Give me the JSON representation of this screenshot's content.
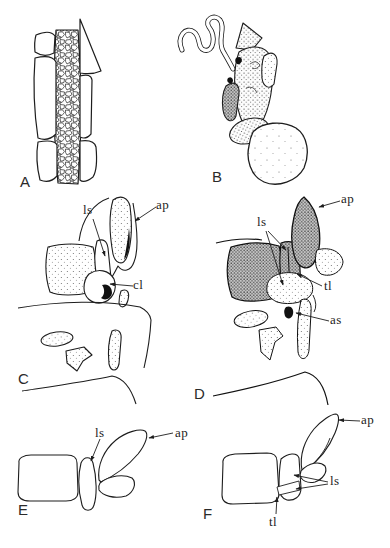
{
  "figure_type": "scientific-plate",
  "colors": {
    "ink": "#1d1d1d",
    "background": "#ffffff"
  },
  "panels": [
    {
      "id": "A",
      "letter": "A",
      "annotations": []
    },
    {
      "id": "B",
      "letter": "B",
      "annotations": []
    },
    {
      "id": "C",
      "letter": "C",
      "annotations": [
        {
          "label": "ls"
        },
        {
          "label": "ap"
        },
        {
          "label": "cl"
        }
      ]
    },
    {
      "id": "D",
      "letter": "D",
      "annotations": [
        {
          "label": "ls"
        },
        {
          "label": "ap"
        },
        {
          "label": "tl"
        },
        {
          "label": "as"
        }
      ]
    },
    {
      "id": "E",
      "letter": "E",
      "annotations": [
        {
          "label": "ls"
        },
        {
          "label": "ap"
        }
      ]
    },
    {
      "id": "F",
      "letter": "F",
      "annotations": [
        {
          "label": "ap"
        },
        {
          "label": "ls"
        },
        {
          "label": "tl"
        }
      ]
    }
  ]
}
